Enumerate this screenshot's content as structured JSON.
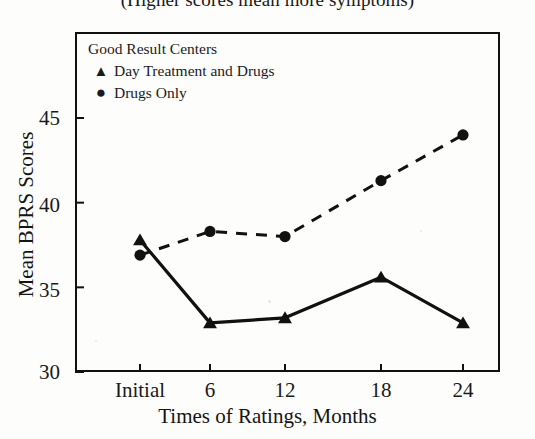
{
  "chart_data": {
    "type": "line",
    "title": "(Higher scores mean more symptoms)",
    "xlabel": "Times of Ratings, Months",
    "ylabel": "Mean BPRS Scores",
    "categories": [
      "Initial",
      "6",
      "12",
      "18",
      "24"
    ],
    "xticks": [
      "Initial",
      "6",
      "12",
      "18",
      "24"
    ],
    "yticks": [
      30,
      35,
      40,
      45
    ],
    "ylim": [
      30,
      46.5
    ],
    "grid": false,
    "legend_position": "top-left-inside",
    "legend_title": "Good Result Centers",
    "series": [
      {
        "name": "Day Treatment and Drugs",
        "marker": "triangle",
        "line_style": "solid",
        "color": "#111111",
        "values": [
          37.8,
          32.9,
          33.2,
          35.6,
          32.9
        ]
      },
      {
        "name": "Drugs Only",
        "marker": "circle",
        "line_style": "dashed",
        "color": "#111111",
        "values": [
          36.9,
          38.3,
          38.0,
          41.3,
          44.0
        ]
      }
    ]
  },
  "legend": {
    "title": "Good Result Centers",
    "items": [
      {
        "marker": "▲",
        "label": "Day Treatment and Drugs"
      },
      {
        "marker": "●",
        "label": "Drugs Only"
      }
    ]
  },
  "axis": {
    "y_title": "Mean BPRS Scores",
    "x_title": "Times of Ratings, Months",
    "y_labels": [
      "45",
      "40",
      "35",
      "30"
    ],
    "x_labels": [
      "Initial",
      "6",
      "12",
      "18",
      "24"
    ]
  }
}
